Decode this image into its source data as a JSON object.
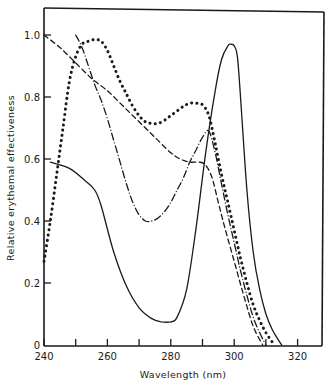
{
  "chart_data": {
    "type": "line",
    "title": "",
    "xlabel": "Wavelength (nm)",
    "ylabel": "Relative erythemal effectiveness",
    "xlim": [
      240,
      328
    ],
    "ylim": [
      0,
      1.08
    ],
    "x_ticks": [
      240,
      250,
      260,
      270,
      280,
      290,
      300,
      310,
      320
    ],
    "x_tick_labels": [
      "240",
      "",
      "260",
      "",
      "280",
      "",
      "300",
      "",
      "320"
    ],
    "y_ticks": [
      0,
      0.2,
      0.4,
      0.6,
      0.8,
      1.0
    ],
    "y_tick_labels": [
      "0",
      "0.2",
      "0.4",
      "0.6",
      "0.8",
      "1.0"
    ],
    "grid": false,
    "legend": null,
    "series": [
      {
        "name": "solid",
        "style": "solid",
        "x": [
          242,
          248,
          253,
          256,
          258,
          262,
          266,
          270,
          274,
          277,
          280,
          282,
          285,
          288,
          291,
          294,
          296,
          298,
          299,
          300,
          301,
          302,
          304,
          306,
          308,
          310,
          312,
          314,
          315
        ],
        "y": [
          0.59,
          0.57,
          0.53,
          0.5,
          0.45,
          0.3,
          0.19,
          0.12,
          0.085,
          0.075,
          0.075,
          0.09,
          0.18,
          0.38,
          0.62,
          0.82,
          0.92,
          0.965,
          0.97,
          0.965,
          0.93,
          0.8,
          0.5,
          0.3,
          0.18,
          0.1,
          0.05,
          0.015,
          0.0
        ]
      },
      {
        "name": "dotted",
        "style": "dotted",
        "x": [
          240,
          242,
          244,
          246,
          248,
          250,
          252,
          254,
          256,
          258,
          260,
          262,
          264,
          266,
          268,
          270,
          272,
          274,
          276,
          278,
          280,
          282,
          284,
          286,
          288,
          290,
          292,
          294,
          296,
          298,
          300,
          302,
          304,
          306,
          308,
          310,
          312,
          313
        ],
        "y": [
          0.27,
          0.4,
          0.55,
          0.7,
          0.85,
          0.93,
          0.97,
          0.98,
          0.985,
          0.98,
          0.95,
          0.9,
          0.85,
          0.81,
          0.77,
          0.74,
          0.72,
          0.715,
          0.715,
          0.725,
          0.74,
          0.755,
          0.77,
          0.78,
          0.78,
          0.775,
          0.74,
          0.65,
          0.55,
          0.46,
          0.37,
          0.28,
          0.2,
          0.13,
          0.08,
          0.04,
          0.01,
          0.0
        ]
      },
      {
        "name": "dashed",
        "style": "dashed",
        "x": [
          240,
          245,
          250,
          255,
          260,
          265,
          270,
          275,
          280,
          283,
          286,
          289,
          291,
          293,
          295,
          297,
          300,
          303,
          306,
          309
        ],
        "y": [
          1.0,
          0.96,
          0.91,
          0.86,
          0.82,
          0.77,
          0.72,
          0.67,
          0.62,
          0.6,
          0.59,
          0.59,
          0.58,
          0.54,
          0.46,
          0.38,
          0.27,
          0.16,
          0.06,
          0.0
        ]
      },
      {
        "name": "dash-dot",
        "style": "dashdot",
        "x": [
          250,
          252,
          254,
          256,
          258,
          260,
          262,
          264,
          266,
          268,
          270,
          272,
          274,
          276,
          278,
          280,
          282,
          284,
          286,
          288,
          290,
          292,
          294,
          296,
          298,
          300,
          302,
          304,
          306,
          308,
          310
        ],
        "y": [
          1.0,
          0.96,
          0.9,
          0.84,
          0.79,
          0.73,
          0.66,
          0.59,
          0.52,
          0.46,
          0.42,
          0.4,
          0.4,
          0.41,
          0.43,
          0.46,
          0.5,
          0.54,
          0.59,
          0.63,
          0.67,
          0.69,
          0.62,
          0.52,
          0.42,
          0.33,
          0.24,
          0.16,
          0.09,
          0.04,
          0.0
        ]
      }
    ]
  },
  "axes": {
    "xlabel": "Wavelength (nm)",
    "ylabel": "Relative erythemal effectiveness",
    "x_tick_labels": [
      "240",
      "260",
      "280",
      "300",
      "320"
    ],
    "y_tick_labels": [
      "0",
      "0.2",
      "0.4",
      "0.6",
      "0.8",
      "1.0"
    ]
  },
  "colors": {
    "ink": "#1a1a1a",
    "background": "#ffffff"
  }
}
